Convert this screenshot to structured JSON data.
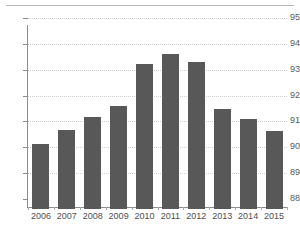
{
  "header": {
    "clipped_text": "",
    "has_rule": true
  },
  "chart_data": {
    "type": "bar",
    "title": "",
    "subtitle": "",
    "xlabel": "",
    "ylabel": "",
    "categories": [
      "2006",
      "2007",
      "2008",
      "2009",
      "2010",
      "2011",
      "2012",
      "2013",
      "2014",
      "2015"
    ],
    "values": [
      90.5,
      91.05,
      91.55,
      92.0,
      93.6,
      94.0,
      93.7,
      91.85,
      91.5,
      91.0
    ],
    "series": [
      {
        "name": "",
        "values": [
          90.5,
          91.05,
          91.55,
          92.0,
          93.6,
          94.0,
          93.7,
          91.85,
          91.5,
          91.0
        ]
      }
    ],
    "ylim": [
      88,
      95
    ],
    "yticks": [
      88,
      89,
      90,
      91,
      92,
      93,
      94,
      95
    ],
    "ytick_labels": [
      "88",
      "89",
      "90",
      "91",
      "92",
      "93",
      "94",
      "95"
    ],
    "xtick_labels": [
      "2006",
      "2007",
      "2008",
      "2009",
      "2010",
      "2011",
      "2012",
      "2013",
      "2014",
      "2015"
    ],
    "grid": true,
    "grid_axis": "y",
    "grid_style": "dotted",
    "legend": false,
    "legend_position": "none",
    "annotations": [],
    "colors": {
      "bar": "#585858",
      "grid": "#cfcfcf",
      "axis": "#8c8c8c",
      "tick_text": "#59595b",
      "background": "#ffffff"
    }
  }
}
